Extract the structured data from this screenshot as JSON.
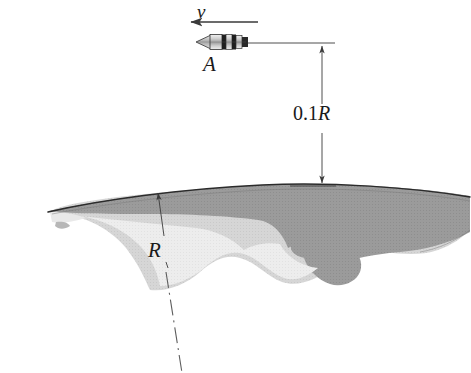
{
  "figure": {
    "labels": {
      "velocity": "v",
      "spacecraft": "A",
      "altitude": "0.1R",
      "radius": "R"
    },
    "colors": {
      "ink": "#1a1a1a",
      "crust_dark": "#9b9b9b",
      "mantle_light": "#d4d4d4",
      "core_pale": "#ececec",
      "outline": "#2b2b2b",
      "background": "#ffffff"
    },
    "geometry": {
      "velocity_arrow": {
        "x_start": 258,
        "x_end": 190,
        "y": 22,
        "direction": "left"
      },
      "spacecraft": {
        "cx": 222,
        "cy": 42,
        "length": 54,
        "height": 15,
        "nose": "left"
      },
      "leader_line_top": {
        "x_start": 248,
        "x_end": 333,
        "y": 43
      },
      "leader_line_bottom": {
        "x_start": 288,
        "x_end": 336,
        "y": 186
      },
      "dimension_line": {
        "x": 322,
        "y_top": 43,
        "y_bottom": 186
      },
      "radius_arrow": {
        "x_start": 163,
        "y_start": 272,
        "x_end": 158,
        "y_end": 192
      },
      "centerline": {
        "x_start": 160,
        "y_start": 278,
        "x_end": 176,
        "y_end": 373,
        "style": "dash-dot"
      }
    },
    "annotations": {
      "altitude_value": 0.1,
      "altitude_unit": "R",
      "planet_radius_symbol": "R"
    }
  }
}
